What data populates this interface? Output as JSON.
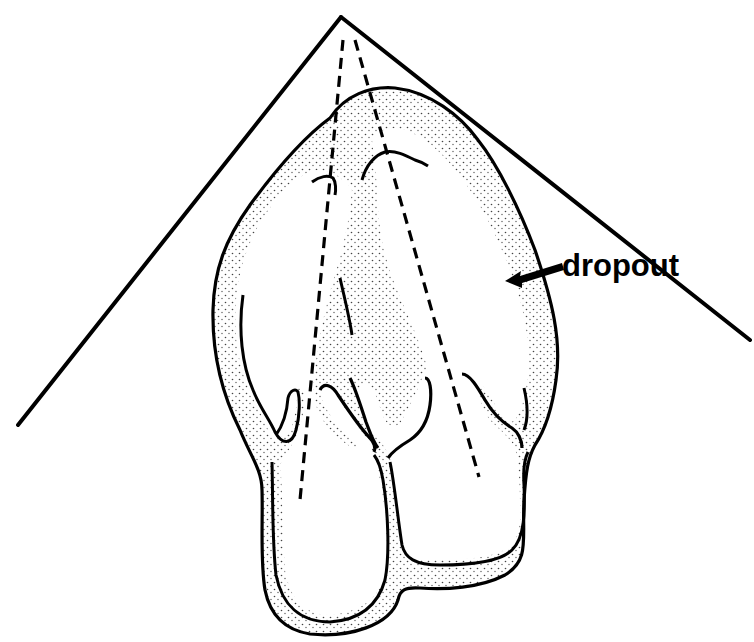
{
  "diagram": {
    "type": "echocardiography-sector-schematic",
    "colors": {
      "line": "#000000",
      "background": "#ffffff",
      "stipple": "#333333"
    },
    "labels": {
      "dropout": "dropout"
    },
    "annotations": [
      {
        "id": "dropout-arrow",
        "text": "dropout",
        "points_to": "lateral wall stippled region"
      }
    ],
    "elements": {
      "sector_apex": [
        341,
        17
      ],
      "sector_left_end": [
        18,
        425
      ],
      "sector_right_end": [
        750,
        340
      ],
      "dashed_lines": [
        {
          "from": [
            343,
            40
          ],
          "to": [
            300,
            500
          ]
        },
        {
          "from": [
            355,
            40
          ],
          "to": [
            479,
            477
          ]
        }
      ]
    }
  }
}
